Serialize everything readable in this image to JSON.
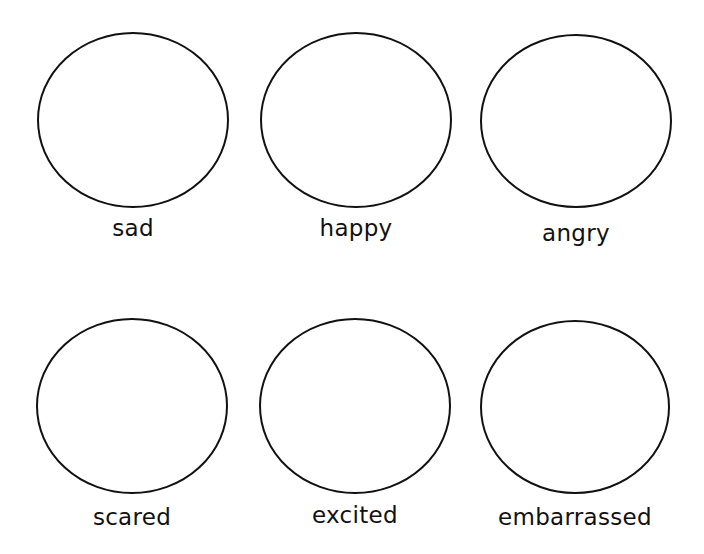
{
  "worksheet": {
    "stroke_color": "#111111",
    "background": "#ffffff",
    "faces": [
      {
        "label": "sad",
        "cx": 133,
        "cy": 120,
        "rx": 95,
        "ry": 87,
        "label_top": 214
      },
      {
        "label": "happy",
        "cx": 356,
        "cy": 120,
        "rx": 95,
        "ry": 87,
        "label_top": 214
      },
      {
        "label": "angry",
        "cx": 576,
        "cy": 121,
        "rx": 95,
        "ry": 86,
        "label_top": 219
      },
      {
        "label": "scared",
        "cx": 132,
        "cy": 406,
        "rx": 95,
        "ry": 87,
        "label_top": 503
      },
      {
        "label": "excited",
        "cx": 355,
        "cy": 406,
        "rx": 95,
        "ry": 87,
        "label_top": 501
      },
      {
        "label": "embarrassed",
        "cx": 575,
        "cy": 407,
        "rx": 94,
        "ry": 86,
        "label_top": 503
      }
    ]
  }
}
